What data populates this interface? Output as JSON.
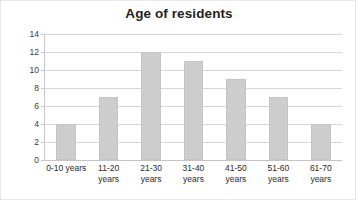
{
  "chart_data": {
    "type": "bar",
    "title": "Age of residents",
    "xlabel": "",
    "ylabel": "",
    "categories": [
      "0-10 years",
      "11-20 years",
      "21-30 years",
      "31-40 years",
      "41-50 years",
      "51-60 years",
      "61-70 years"
    ],
    "category_lines": [
      [
        "0-10 years"
      ],
      [
        "11-20",
        "years"
      ],
      [
        "21-30",
        "years"
      ],
      [
        "31-40",
        "years"
      ],
      [
        "41-50",
        "years"
      ],
      [
        "51-60",
        "years"
      ],
      [
        "61-70",
        "years"
      ]
    ],
    "values": [
      4,
      7,
      12,
      11,
      9,
      7,
      4
    ],
    "ylim": [
      0,
      14
    ],
    "ytick_step": 2,
    "yticks": [
      0,
      2,
      4,
      6,
      8,
      10,
      12,
      14
    ],
    "ytick_labels": [
      "0",
      "2",
      "4",
      "6",
      "8",
      "10",
      "12",
      "14"
    ],
    "grid": true,
    "legend": false,
    "legend_position": "none",
    "bar_color": "#cdcdcd",
    "gridline_color": "#d6d6d6",
    "axis_color": "#c9c9c9",
    "title_color": "#1f1f1f",
    "background_color": "#ffffff"
  }
}
